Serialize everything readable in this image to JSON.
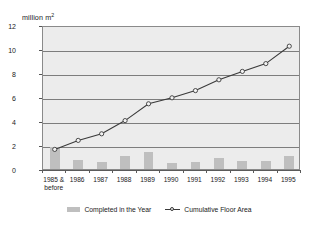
{
  "chart_data": {
    "type": "bar",
    "title": "",
    "subtitle": "",
    "xlabel": "",
    "ylabel": "million m2",
    "ylabel_display": "million m",
    "ylabel_sup": "2",
    "categories": [
      "1985 & before",
      "1986",
      "1987",
      "1988",
      "1989",
      "1990",
      "1991",
      "1992",
      "1993",
      "1994",
      "1995"
    ],
    "category_lines": [
      [
        "1985 &",
        "before"
      ],
      [
        "1986",
        ""
      ],
      [
        "1987",
        ""
      ],
      [
        "1988",
        ""
      ],
      [
        "1989",
        ""
      ],
      [
        "1990",
        ""
      ],
      [
        "1991",
        ""
      ],
      [
        "1992",
        ""
      ],
      [
        "1993",
        ""
      ],
      [
        "1994",
        ""
      ],
      [
        "1995",
        ""
      ]
    ],
    "ylim": [
      0,
      12
    ],
    "yticks": [
      0,
      2,
      4,
      6,
      8,
      10,
      12
    ],
    "ytick_labels": [
      "0",
      "2",
      "4",
      "6",
      "8",
      "10",
      "12"
    ],
    "grid": true,
    "legend_position": "bottom-center",
    "series": [
      {
        "name": "Completed in the Year",
        "type": "bar",
        "color": "#bfbfbf",
        "values": [
          1.8,
          0.75,
          0.55,
          1.1,
          1.4,
          0.5,
          0.6,
          0.9,
          0.7,
          0.65,
          1.1
        ]
      },
      {
        "name": "Cumulative Floor Area",
        "type": "line",
        "color": "#3a3a3a",
        "marker": "open-circle",
        "values": [
          1.8,
          2.55,
          3.1,
          4.2,
          5.6,
          6.1,
          6.7,
          7.6,
          8.3,
          8.95,
          10.4
        ]
      }
    ]
  },
  "legend": {
    "items": [
      {
        "label": "Completed in the Year",
        "swatch": "bar-swatch-icon"
      },
      {
        "label": "Cumulative Floor Area",
        "swatch": "line-marker-swatch-icon"
      }
    ]
  },
  "colors": {
    "plot_background": "#ececec",
    "plot_border": "#8a8a8a",
    "gridline": "#7d7d7d",
    "bar_fill": "#bfbfbf",
    "line_stroke": "#3a3a3a",
    "marker_fill": "#f2f2f2",
    "page_background": "#ffffff",
    "text": "#1a1a1a"
  }
}
